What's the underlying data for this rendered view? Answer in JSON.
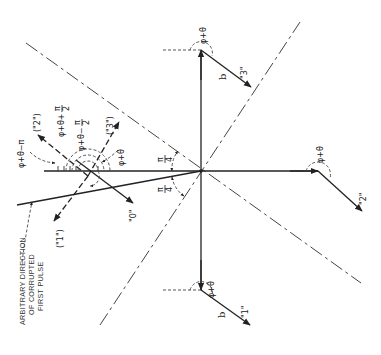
{
  "diagram": {
    "center_label": "",
    "angle_labels": {
      "phi_theta": "φ+θ",
      "phi_theta_minus_pi": "φ+θ−π",
      "phi_theta_plus_pi2": "φ+θ+",
      "phi_theta_minus_pi2": "φ+θ−",
      "pi_over_2": "π/2",
      "pi_over_4": "π/4",
      "pi_num": "π",
      "four_den": "4",
      "two_den": "2"
    },
    "vectors": {
      "b_label": "b",
      "state_0": "\"0\"",
      "state_1": "\"1\"",
      "state_2": "\"2\"",
      "state_3": "\"3\"",
      "state_1_alt": "(\"1\")",
      "state_2_alt": "(\"2\")",
      "state_3_alt": "(\"3\")"
    },
    "annotation": {
      "line1": "ARBITRARY  DIRECTION",
      "line2": "OF  CORRUPTED",
      "line3": "FIRST PULSE"
    },
    "colors": {
      "ink": "#222222",
      "background": "#ffffff"
    }
  }
}
